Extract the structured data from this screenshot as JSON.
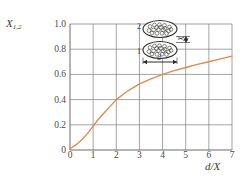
{
  "chart_data": {
    "type": "line",
    "title": "",
    "xlabel": "d/X",
    "ylabel": "X1,2",
    "xlim": [
      0,
      7
    ],
    "ylim": [
      0,
      1.0
    ],
    "grid": true,
    "legend": "none",
    "xticks": [
      "0",
      "1",
      "2",
      "3",
      "4",
      "5",
      "6",
      "7"
    ],
    "xtick_values": [
      0,
      1,
      2,
      3,
      4,
      5,
      6,
      7
    ],
    "yticks": [
      "0",
      "0.2",
      "0.4",
      "0.6",
      "0.8",
      "1.0"
    ],
    "ytick_values": [
      0,
      0.2,
      0.4,
      0.6,
      0.8,
      1.0
    ],
    "series": [
      {
        "name": "X1,2",
        "color": "#e08a50",
        "x": [
          0.0,
          0.25,
          0.5,
          0.75,
          1.0,
          1.25,
          1.5,
          1.75,
          2.0,
          2.5,
          3.0,
          3.5,
          4.0,
          4.5,
          5.0,
          5.5,
          6.0,
          6.5,
          7.0
        ],
        "values": [
          0.01,
          0.04,
          0.08,
          0.13,
          0.19,
          0.25,
          0.3,
          0.35,
          0.4,
          0.47,
          0.525,
          0.565,
          0.6,
          0.63,
          0.655,
          0.68,
          0.7,
          0.723,
          0.745
        ]
      }
    ]
  },
  "axis_labels": {
    "y": "X",
    "y_sub": "1,2",
    "x": "d/X"
  },
  "inset": {
    "label_top": "2",
    "label_bottom": "1",
    "dim_vertical": "X",
    "dim_horizontal": "d"
  },
  "colors": {
    "curve": "#e08a50",
    "grid": "#7d7d7d",
    "axis": "#6b6b6b",
    "text": "#3a3a3a"
  }
}
